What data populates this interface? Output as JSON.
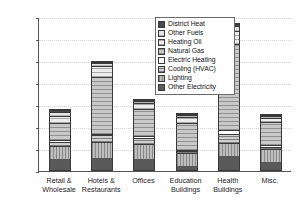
{
  "chart_data": {
    "type": "bar",
    "stacked": true,
    "title": "",
    "xlabel": "",
    "ylabel": "Energy Intensity (kWh/m2/yr)",
    "ylabel_display": "Energy Intensity (kWh/m",
    "ylabel_sup": "2",
    "ylabel_tail": "/yr)",
    "ylim": [
      0,
      700
    ],
    "ytick_step": 100,
    "yticks": [
      0,
      100,
      200,
      300,
      400,
      500,
      600,
      700
    ],
    "grid": true,
    "legend_position": "top-center-inside",
    "categories": [
      "Retail & Wholesale",
      "Hotels & Restaurants",
      "Offices",
      "Education Buildings",
      "Health Buildings",
      "Misc."
    ],
    "category_lines": [
      [
        "Retail &",
        "Wholesale"
      ],
      [
        "Hotels &",
        "Restaurants"
      ],
      [
        "Offices",
        ""
      ],
      [
        "Education",
        "Buildings"
      ],
      [
        "Health",
        "Buildings"
      ],
      [
        "Misc.",
        ""
      ]
    ],
    "series": [
      {
        "name": "Other Electricity",
        "fill": "f-other-electricity",
        "values": [
          52,
          57,
          50,
          21,
          66,
          36
        ]
      },
      {
        "name": "Lighting",
        "fill": "f-lighting",
        "values": [
          62,
          72,
          73,
          58,
          58,
          66
        ]
      },
      {
        "name": "Cooling (HVAC)",
        "fill": "f-cooling",
        "values": [
          20,
          34,
          26,
          12,
          40,
          9
        ]
      },
      {
        "name": "Electric Heating",
        "fill": "f-electric-heating",
        "values": [
          9,
          5,
          13,
          6,
          21,
          9
        ]
      },
      {
        "name": "Natural Gas",
        "fill": "f-natural-gas",
        "values": [
          79,
          264,
          123,
          125,
          394,
          107
        ]
      },
      {
        "name": "Heating Oil",
        "fill": "f-heating-oil",
        "values": [
          32,
          50,
          28,
          32,
          60,
          21
        ]
      },
      {
        "name": "Other Fuels",
        "fill": "f-other-fuels",
        "values": [
          21,
          12,
          12,
          6,
          24,
          9
        ]
      },
      {
        "name": "District Heat",
        "fill": "f-district-heat",
        "values": [
          5,
          6,
          3,
          2,
          8,
          3
        ]
      }
    ],
    "totals": [
      280,
      500,
      328,
      262,
      671,
      260
    ],
    "legend_entries": [
      {
        "label": "District Heat",
        "fill": "f-district-heat"
      },
      {
        "label": "Other Fuels",
        "fill": "f-other-fuels"
      },
      {
        "label": "Heating Oil",
        "fill": "f-heating-oil"
      },
      {
        "label": "Natural Gas",
        "fill": "f-natural-gas"
      },
      {
        "label": "Electric Heating",
        "fill": "f-electric-heating"
      },
      {
        "label": "Cooling (HVAC)",
        "fill": "f-cooling"
      },
      {
        "label": "Lighting",
        "fill": "f-lighting"
      },
      {
        "label": "Other Electricity",
        "fill": "f-other-electricity"
      }
    ]
  }
}
